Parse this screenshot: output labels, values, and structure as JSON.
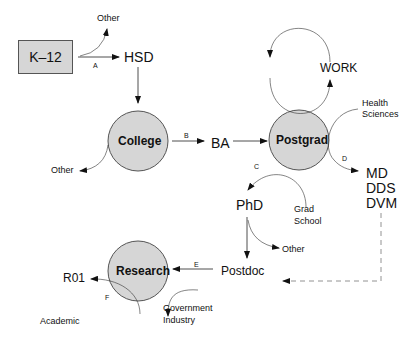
{
  "diagram": {
    "type": "flow",
    "nodes": {
      "k12": "K–12",
      "hsd": "HSD",
      "college": "College",
      "ba": "BA",
      "postgrad": "Postgrad",
      "work": "WORK",
      "health_sciences": [
        "Health",
        "Sciences"
      ],
      "md": "MD",
      "dds": "DDS",
      "dvm": "DVM",
      "phd": "PhD",
      "grad_school": [
        "Grad",
        "School"
      ],
      "postdoc": "Postdoc",
      "research": "Research",
      "r01": "R01",
      "academic": "Academic",
      "government_industry": [
        "Government",
        "Industry"
      ],
      "other_top": "Other",
      "other_college": "Other",
      "other_phd": "Other"
    },
    "edge_labels": {
      "a": "A",
      "b": "B",
      "c": "C",
      "d": "D",
      "e": "E",
      "f": "F"
    },
    "colors": {
      "node_fill": "#d6d6d6",
      "stroke": "#222222",
      "dashed": "#777777"
    }
  }
}
